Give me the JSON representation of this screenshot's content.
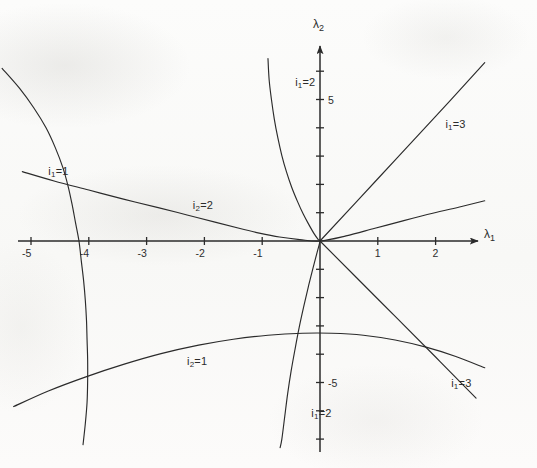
{
  "figure": {
    "background_color": "#fbfbfa",
    "ink_color": "#2b2b2b"
  },
  "chart_data": {
    "type": "line",
    "title": "",
    "subtitle": "",
    "xlabel": "λ₁",
    "ylabel": "λ₂",
    "xlabel_base": "λ",
    "xlabel_sub": "1",
    "ylabel_base": "λ",
    "ylabel_sub": "2",
    "grid": false,
    "legend_position": "inline-curve-labels",
    "xlim": [
      -5.6,
      3.0
    ],
    "ylim": [
      -7.3,
      6.6
    ],
    "x_ticks": [
      -5,
      -4,
      -3,
      -2,
      -1,
      1,
      2
    ],
    "x_tick_labels": [
      "-5",
      "-4",
      "-3",
      "-2",
      "-1",
      "1",
      "2"
    ],
    "y_ticks": [
      -7,
      -6,
      -5,
      -4,
      -3,
      -2,
      -1,
      1,
      2,
      3,
      4,
      5,
      6
    ],
    "y_tick_labels_shown": [
      {
        "value": 5,
        "label": "5"
      },
      {
        "value": -5,
        "label": "-5"
      }
    ],
    "series": [
      {
        "name": "i1_eq_1",
        "label_base": "i",
        "label_sub": "1",
        "label_rhs": "=1",
        "label_text": "i₁=1",
        "description": "steep curve in left half-plane crossing λ₁ axis near -4.15",
        "points": [
          [
            -5.5,
            6.1
          ],
          [
            -5.2,
            5.4
          ],
          [
            -4.95,
            4.7
          ],
          [
            -4.74,
            4.0
          ],
          [
            -4.58,
            3.3
          ],
          [
            -4.45,
            2.6
          ],
          [
            -4.36,
            1.95
          ],
          [
            -4.29,
            1.3
          ],
          [
            -4.23,
            0.65
          ],
          [
            -4.17,
            0.0
          ],
          [
            -4.13,
            -0.7
          ],
          [
            -4.09,
            -1.4
          ],
          [
            -4.06,
            -2.1
          ],
          [
            -4.04,
            -2.8
          ],
          [
            -4.03,
            -3.5
          ],
          [
            -4.02,
            -4.2
          ],
          [
            -4.02,
            -4.95
          ],
          [
            -4.03,
            -5.7
          ],
          [
            -4.06,
            -6.45
          ],
          [
            -4.1,
            -7.2
          ]
        ]
      },
      {
        "name": "i1_eq_2",
        "label_base": "i",
        "label_sub": "1",
        "label_rhs": "=2",
        "label_text": "i₁=2",
        "description": "hyperbola-like branch from upper area bending to the origin then down to lower area",
        "points": [
          [
            -0.9,
            6.45
          ],
          [
            -0.88,
            5.7
          ],
          [
            -0.84,
            5.0
          ],
          [
            -0.79,
            4.3
          ],
          [
            -0.73,
            3.65
          ],
          [
            -0.66,
            3.02
          ],
          [
            -0.58,
            2.44
          ],
          [
            -0.49,
            1.9
          ],
          [
            -0.39,
            1.4
          ],
          [
            -0.29,
            0.95
          ],
          [
            -0.19,
            0.57
          ],
          [
            -0.1,
            0.25
          ],
          [
            -0.03,
            0.05
          ],
          [
            0.0,
            0.0
          ],
          [
            -0.05,
            -0.4
          ],
          [
            -0.12,
            -0.95
          ],
          [
            -0.2,
            -1.6
          ],
          [
            -0.28,
            -2.3
          ],
          [
            -0.36,
            -3.05
          ],
          [
            -0.43,
            -3.8
          ],
          [
            -0.5,
            -4.6
          ],
          [
            -0.56,
            -5.4
          ],
          [
            -0.61,
            -6.2
          ],
          [
            -0.66,
            -7.0
          ],
          [
            -0.69,
            -7.3
          ]
        ]
      },
      {
        "name": "i1_eq_3_upper",
        "label_base": "i",
        "label_sub": "1",
        "label_rhs": "=3",
        "label_text": "i₁=3",
        "description": "straight ray rising to the upper right from the origin",
        "points": [
          [
            0.0,
            0.0
          ],
          [
            1.0,
            2.2
          ],
          [
            2.0,
            4.4
          ],
          [
            2.85,
            6.3
          ]
        ]
      },
      {
        "name": "i1_eq_3_lower",
        "label_base": "i",
        "label_sub": "1",
        "label_rhs": "=3",
        "label_text": "i₁=3",
        "description": "straight ray descending to the lower right from the origin",
        "points": [
          [
            0.0,
            0.0
          ],
          [
            1.0,
            -2.05
          ],
          [
            2.0,
            -4.1
          ],
          [
            2.7,
            -5.55
          ]
        ]
      },
      {
        "name": "i2_eq_2",
        "label_base": "i",
        "label_sub": "2",
        "label_rhs": "=2",
        "label_text": "i₂=2",
        "description": "shallow curve from upper-left descending toward the origin and then rising to the right",
        "points": [
          [
            -5.15,
            2.45
          ],
          [
            -4.6,
            2.12
          ],
          [
            -4.0,
            1.8
          ],
          [
            -3.4,
            1.48
          ],
          [
            -2.8,
            1.18
          ],
          [
            -2.3,
            0.92
          ],
          [
            -1.8,
            0.66
          ],
          [
            -1.4,
            0.45
          ],
          [
            -1.05,
            0.28
          ],
          [
            -0.7,
            0.14
          ],
          [
            -0.35,
            0.05
          ],
          [
            0.0,
            0.0
          ],
          [
            0.45,
            0.18
          ],
          [
            0.95,
            0.45
          ],
          [
            1.45,
            0.72
          ],
          [
            1.95,
            0.98
          ],
          [
            2.45,
            1.22
          ],
          [
            2.85,
            1.42
          ]
        ]
      },
      {
        "name": "i2_eq_1",
        "label_base": "i",
        "label_sub": "2",
        "label_rhs": "=1",
        "label_text": "i₂=1",
        "description": "broad arc in the lower half-plane peaking near λ₁ = 0.1",
        "points": [
          [
            -5.3,
            -5.85
          ],
          [
            -4.7,
            -5.3
          ],
          [
            -4.05,
            -4.8
          ],
          [
            -3.4,
            -4.36
          ],
          [
            -2.75,
            -3.98
          ],
          [
            -2.1,
            -3.68
          ],
          [
            -1.5,
            -3.47
          ],
          [
            -0.9,
            -3.33
          ],
          [
            -0.3,
            -3.26
          ],
          [
            0.2,
            -3.26
          ],
          [
            0.75,
            -3.33
          ],
          [
            1.3,
            -3.5
          ],
          [
            1.85,
            -3.76
          ],
          [
            2.35,
            -4.08
          ],
          [
            2.85,
            -4.48
          ]
        ]
      }
    ],
    "curve_labels": [
      {
        "text": "i₁=1",
        "base": "i",
        "sub": "1",
        "rhs": "=1",
        "x": -4.7,
        "y": 2.45
      },
      {
        "text": "i₁=2",
        "base": "i",
        "sub": "1",
        "rhs": "=2",
        "x": -0.43,
        "y": 5.6
      },
      {
        "text": "i₁=3",
        "base": "i",
        "sub": "1",
        "rhs": "=3",
        "x": 2.17,
        "y": 4.1
      },
      {
        "text": "i₂=2",
        "base": "i",
        "sub": "2",
        "rhs": "=2",
        "x": -2.2,
        "y": 1.25
      },
      {
        "text": "i₂=1",
        "base": "i",
        "sub": "2",
        "rhs": "=1",
        "x": -2.3,
        "y": -4.28
      },
      {
        "text": "i₁=2",
        "base": "i",
        "sub": "1",
        "rhs": "=2",
        "x": -0.15,
        "y": -6.1
      },
      {
        "text": "i₁=3",
        "base": "i",
        "sub": "1",
        "rhs": "=3",
        "x": 2.27,
        "y": -5.05
      }
    ]
  },
  "axes": {
    "origin_px": {
      "x": 320,
      "y": 241
    },
    "x_unit_px": 57.8,
    "y_unit_px": 28.3,
    "x_axis_arrow": true,
    "y_axis_arrow": true
  }
}
